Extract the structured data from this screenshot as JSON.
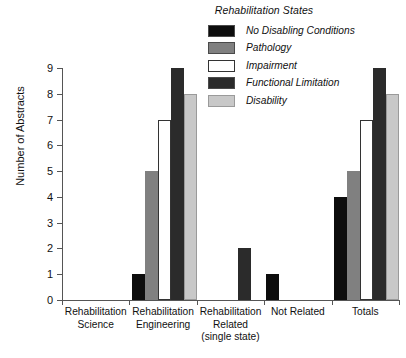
{
  "chart_data": {
    "type": "bar",
    "title": "",
    "xlabel": "",
    "ylabel": "Number of Abstracts",
    "ylim": [
      0,
      9
    ],
    "ytick_labels": [
      "0",
      "1",
      "2",
      "3",
      "4",
      "5",
      "6",
      "7",
      "8",
      "9"
    ],
    "grid": false,
    "legend_position": "top-center",
    "legend_title": "Rehabilitation States",
    "categories": [
      "Rehabilitation Science",
      "Rehabilitation Engineering",
      "Rehabilitation Related (single state)",
      "Not Related",
      "Totals"
    ],
    "category_lines": [
      [
        "Rehabilitation",
        "Science"
      ],
      [
        "Rehabilitation",
        "Engineering"
      ],
      [
        "Rehabilitation",
        "Related",
        "(single state)"
      ],
      [
        "Not Related"
      ],
      [
        "Totals"
      ]
    ],
    "series": [
      {
        "name": "No Disabling Conditions",
        "color": "#0d0d0d",
        "values": [
          0,
          1,
          0,
          1,
          4
        ]
      },
      {
        "name": "Pathology",
        "color": "#808080",
        "values": [
          0,
          5,
          0,
          0,
          5
        ]
      },
      {
        "name": "Impairment",
        "color": "#ffffff",
        "values": [
          0,
          7,
          0,
          0,
          7
        ]
      },
      {
        "name": "Functional Limitation",
        "color": "#2b2b2b",
        "values": [
          0,
          9,
          2,
          0,
          9
        ]
      },
      {
        "name": "Disability",
        "color": "#c8c8c8",
        "values": [
          0,
          8,
          0,
          0,
          8
        ]
      }
    ]
  }
}
